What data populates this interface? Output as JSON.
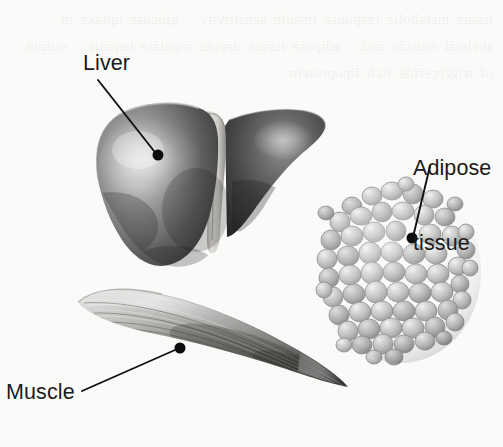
{
  "figure": {
    "width": 503,
    "height": 447,
    "background_color": "#fbfbf9",
    "style": "grayscale scanned textbook illustration",
    "bleed_through_text": "tissue metabolic response insulin sensitivity   glucose uptake in skeletal muscle and   adipose tissue depots regulate hepatic   output of triglyceride rich lipoprotein"
  },
  "labels": {
    "liver": {
      "text": "Liver",
      "x": 83,
      "y": 51,
      "dot": {
        "x": 158,
        "y": 155,
        "r": 5.5
      },
      "leader": {
        "x1": 98,
        "y1": 80,
        "x2": 154,
        "y2": 151
      }
    },
    "adipose": {
      "line1": "Adipose",
      "line2": "tissue",
      "x": 413,
      "y": 106,
      "dot": {
        "x": 412,
        "y": 238,
        "r": 5.5
      },
      "leader": {
        "x1": 430,
        "y1": 166,
        "x2": 414,
        "y2": 233
      }
    },
    "muscle": {
      "text": "Muscle",
      "x": 6,
      "y": 380,
      "dot": {
        "x": 180,
        "y": 348,
        "r": 5.5
      },
      "leader": {
        "x1": 82,
        "y1": 391,
        "x2": 175,
        "y2": 350
      }
    }
  },
  "colors": {
    "label_text": "#1b1b1b",
    "leader_line": "#111111",
    "leader_dot": "#0d0d0d",
    "liver_highlight": "#c9c9c9",
    "liver_mid": "#7c7c7c",
    "liver_dark": "#2f2f2f",
    "ligament_light": "#d8d6d0",
    "adipose_cell": "#c6c6c4",
    "adipose_highlight": "#ececea",
    "adipose_outline": "#8c8c8a",
    "muscle_light": "#d6d6d4",
    "muscle_mid": "#9a9a98",
    "muscle_dark": "#3d3d3d"
  },
  "anatomy": {
    "liver": {
      "name": "liver",
      "parts": [
        "left-lobe",
        "right-lobe",
        "falciform-ligament"
      ],
      "bbox": [
        95,
        104,
        230,
        165
      ]
    },
    "adipose_tissue": {
      "name": "adipose-tissue",
      "parts": [
        "adipocyte-cluster"
      ],
      "cell_count": 92,
      "bbox": [
        324,
        184,
        154,
        178
      ]
    },
    "muscle": {
      "name": "skeletal-muscle",
      "parts": [
        "fusiform-belly",
        "fiber-striations",
        "tendon-taper"
      ],
      "bbox": [
        76,
        286,
        272,
        112
      ]
    }
  }
}
